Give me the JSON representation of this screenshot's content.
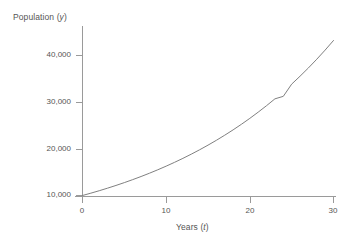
{
  "figure": {
    "background_color": "#ffffff",
    "line_color": "#808080",
    "axis_color": "#9a9a9a",
    "text_color": "#555555"
  },
  "labels": {
    "y_axis_title_main": "Population (",
    "y_axis_title_var": "y",
    "y_axis_title_close": ")",
    "x_axis_title_main": "Years (",
    "x_axis_title_var": "t",
    "x_axis_title_close": ")"
  },
  "chart_data": {
    "type": "line",
    "title": "",
    "xlabel": "Years (t)",
    "ylabel": "Population (y)",
    "xlim": [
      0,
      30
    ],
    "ylim": [
      8000,
      46000
    ],
    "grid": false,
    "legend": "none",
    "x_ticks": [
      0,
      10,
      20,
      30
    ],
    "x_tick_labels": [
      "0",
      "10",
      "20",
      "30"
    ],
    "y_ticks": [
      10000,
      20000,
      30000,
      40000
    ],
    "y_tick_labels": [
      "10,000",
      "20,000",
      "30,000",
      "40,000"
    ],
    "series": [
      {
        "name": "Population growth",
        "x": [
          0,
          1,
          2,
          3,
          4,
          5,
          6,
          7,
          8,
          9,
          10,
          11,
          12,
          13,
          14,
          15,
          16,
          17,
          18,
          19,
          20,
          21,
          22,
          23,
          24,
          25,
          26,
          27,
          28,
          29,
          30
        ],
        "values": [
          10000,
          10500,
          11025,
          11576,
          12155,
          12763,
          13401,
          14071,
          14775,
          15513,
          16289,
          17103,
          17959,
          18856,
          19799,
          20789,
          21829,
          22920,
          24066,
          25270,
          26533,
          27860,
          29253,
          30715,
          31251,
          33864,
          35557,
          37335,
          39201,
          41161,
          43219
        ]
      }
    ]
  }
}
